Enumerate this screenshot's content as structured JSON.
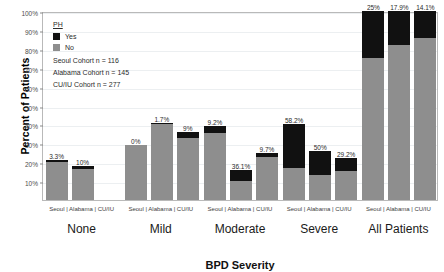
{
  "chart_data": {
    "type": "bar",
    "title": "",
    "xlabel": "BPD Severity",
    "ylabel": "Percent of Patients",
    "ylim": [
      0,
      100
    ],
    "ytick_labels": [
      "10%",
      "20%",
      "30%",
      "40%",
      "50%",
      "60%",
      "70%",
      "80%",
      "90%",
      "100%"
    ],
    "ytick_values": [
      10,
      20,
      30,
      40,
      50,
      60,
      70,
      80,
      90,
      100
    ],
    "grid": true,
    "stacked": true,
    "legend_position": "top-left-inside",
    "legend_title": "PH",
    "series": [
      {
        "name": "Yes",
        "color": "#111111"
      },
      {
        "name": "No",
        "color": "#8e8e8e"
      }
    ],
    "categories": [
      "None",
      "Mild",
      "Moderate",
      "Severe",
      "All Patients"
    ],
    "cohorts": [
      "Seoul",
      "Alabama",
      "CU/IU"
    ],
    "groups": [
      {
        "category": "None",
        "bars": [
          {
            "cohort": "Seoul",
            "total": 21.0,
            "yes_pct": 3.3,
            "label": "3.3%"
          },
          {
            "cohort": "Alabama",
            "total": 18.0,
            "yes_pct": 10.0,
            "label": "10%"
          },
          {
            "cohort": "CU/IU",
            "total": 0.0,
            "yes_pct": 0.0,
            "label": ""
          }
        ]
      },
      {
        "category": "Mild",
        "bars": [
          {
            "cohort": "Seoul",
            "total": 29.0,
            "yes_pct": 0.0,
            "label": "0%"
          },
          {
            "cohort": "Alabama",
            "total": 41.0,
            "yes_pct": 1.7,
            "label": "1.7%"
          },
          {
            "cohort": "CU/IU",
            "total": 36.0,
            "yes_pct": 9.0,
            "label": "9%"
          }
        ]
      },
      {
        "category": "Moderate",
        "bars": [
          {
            "cohort": "Seoul",
            "total": 39.0,
            "yes_pct": 9.2,
            "label": "9.2%"
          },
          {
            "cohort": "Alabama",
            "total": 16.0,
            "yes_pct": 36.1,
            "label": "36.1%"
          },
          {
            "cohort": "CU/IU",
            "total": 25.0,
            "yes_pct": 9.7,
            "label": "9.7%"
          }
        ]
      },
      {
        "category": "Severe",
        "bars": [
          {
            "cohort": "Seoul",
            "total": 40.0,
            "yes_pct": 58.2,
            "label": "58.2%"
          },
          {
            "cohort": "Alabama",
            "total": 26.0,
            "yes_pct": 50.0,
            "label": "50%"
          },
          {
            "cohort": "CU/IU",
            "total": 22.0,
            "yes_pct": 29.2,
            "label": "29.2%"
          }
        ]
      },
      {
        "category": "All Patients",
        "bars": [
          {
            "cohort": "Seoul",
            "total": 100.0,
            "yes_pct": 25.0,
            "label": "25%"
          },
          {
            "cohort": "Alabama",
            "total": 100.0,
            "yes_pct": 17.9,
            "label": "17.9%"
          },
          {
            "cohort": "CU/IU",
            "total": 100.0,
            "yes_pct": 14.1,
            "label": "14.1%"
          }
        ]
      }
    ],
    "annotations": [
      "Seoul Cohort n = 116",
      "Alabama Cohort n = 145",
      "CU/IU Cohort n = 277"
    ]
  },
  "legend": {
    "title": "PH",
    "yes_label": "Yes",
    "no_label": "No",
    "cohort_lines": [
      "Seoul Cohort n = 116",
      "Alabama Cohort n = 145",
      "CU/IU Cohort n = 277"
    ]
  },
  "axes": {
    "y_title": "Percent of Patients",
    "x_title": "BPD Severity",
    "group_sublabel": "Seoul | Alabama | CU/IU"
  }
}
